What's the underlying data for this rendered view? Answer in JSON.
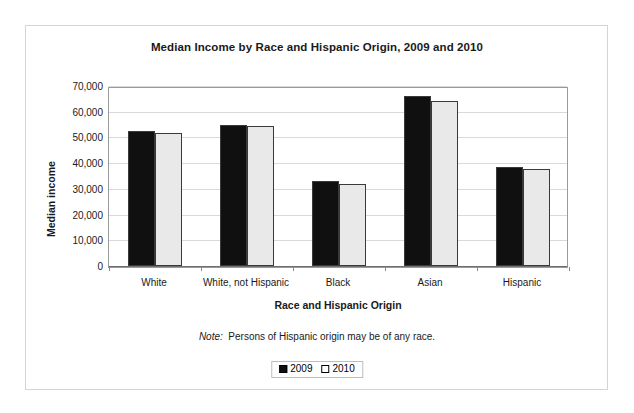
{
  "chart_data": {
    "type": "bar",
    "title": "Median Income by Race and Hispanic Origin, 2009 and 2010",
    "xlabel": "Race and Hispanic Origin",
    "ylabel": "Median income",
    "categories": [
      "White",
      "White, not Hispanic",
      "Black",
      "Asian",
      "Hispanic"
    ],
    "series": [
      {
        "name": "2009",
        "values": [
          52500,
          55000,
          33000,
          66000,
          38500
        ],
        "color": "#101010"
      },
      {
        "name": "2010",
        "values": [
          51800,
          54500,
          32000,
          64200,
          37600
        ],
        "color": "#e9e9e9"
      }
    ],
    "ylim": [
      0,
      70000
    ],
    "ytick_values": [
      70000,
      60000,
      50000,
      40000,
      30000,
      20000,
      10000,
      0
    ],
    "ytick_labels": [
      "70,000",
      "60,000",
      "50,000",
      "40,000",
      "30,000",
      "20,000",
      "10,000",
      "0"
    ],
    "grid": true,
    "legend_position": "bottom"
  },
  "note": {
    "emphasis": "Note:",
    "text": "Persons of Hispanic origin may be of any race."
  },
  "legend": {
    "items": [
      {
        "label": "2009",
        "swatch": "black-square-icon"
      },
      {
        "label": "2010",
        "swatch": "white-square-icon"
      }
    ]
  }
}
